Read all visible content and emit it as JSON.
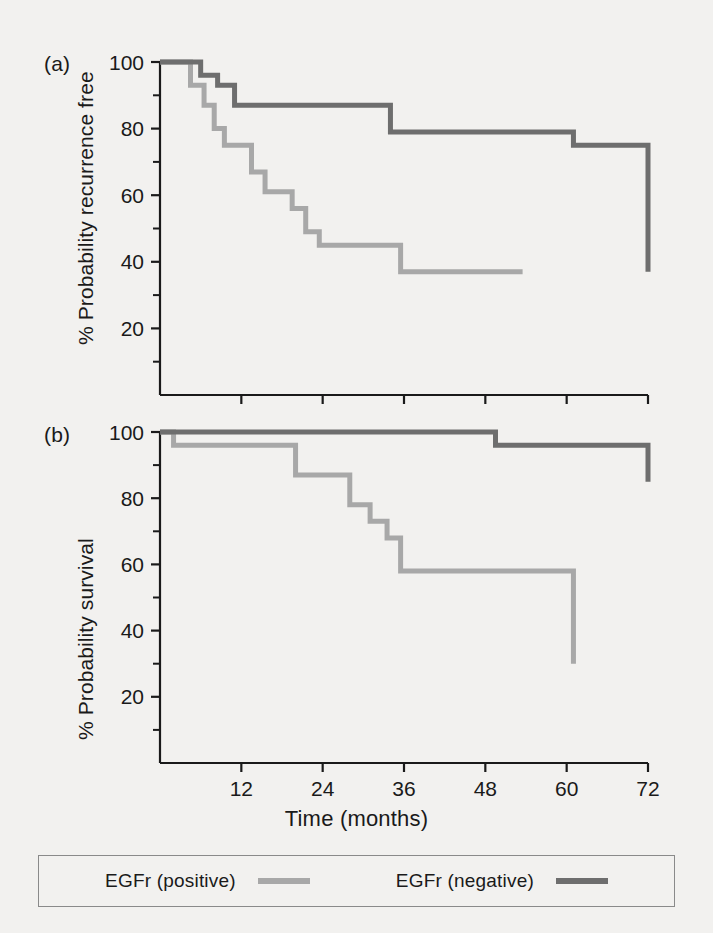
{
  "figure": {
    "background_color": "#f2f1ef",
    "axis_color": "#1a1a1a"
  },
  "panel_a": {
    "tag": "(a)",
    "ylabel": "% Probability recurrence free"
  },
  "panel_b": {
    "tag": "(b)",
    "ylabel": "% Probability survival"
  },
  "xlabel": "Time (months)",
  "legend": {
    "entries": [
      {
        "label": "EGFr (positive)",
        "color": "#a8a8a8"
      },
      {
        "label": "EGFr (negative)",
        "color": "#6e6e6e"
      }
    ]
  },
  "axis": {
    "x_ticks": [
      "12",
      "24",
      "36",
      "48",
      "60",
      "72"
    ],
    "y_ticks": [
      "20",
      "40",
      "60",
      "80",
      "100"
    ]
  },
  "chart_data": [
    {
      "type": "line",
      "panel": "(a)",
      "title": "",
      "xlabel": "Time (months)",
      "ylabel": "% Probability recurrence free",
      "xlim": [
        0,
        72
      ],
      "ylim": [
        0,
        100
      ],
      "xticks": [
        0,
        12,
        24,
        36,
        48,
        60,
        72
      ],
      "yticks": [
        20,
        40,
        60,
        80,
        100
      ],
      "yminor": [
        10,
        30,
        50,
        70,
        90
      ],
      "grid": false,
      "step": "post",
      "legend_position": "below-figure",
      "series": [
        {
          "name": "EGFr (positive)",
          "color": "#a8a8a8",
          "x": [
            0,
            2.5,
            4.5,
            6.5,
            8.0,
            9.5,
            11.5,
            13.5,
            15.5,
            17.5,
            19.5,
            21.5,
            23.5,
            26.5,
            35.5,
            53.5
          ],
          "y": [
            100,
            100,
            93,
            87,
            80,
            75,
            75,
            67,
            61,
            61,
            56,
            49,
            45,
            45,
            37,
            37
          ]
        },
        {
          "name": "EGFr (negative)",
          "color": "#6e6e6e",
          "x": [
            0,
            4.0,
            6.0,
            8.5,
            11.0,
            25.0,
            34.0,
            61.0,
            72.0
          ],
          "y": [
            100,
            100,
            96,
            93,
            87,
            87,
            79,
            75,
            37
          ]
        }
      ]
    },
    {
      "type": "line",
      "panel": "(b)",
      "title": "",
      "xlabel": "Time (months)",
      "ylabel": "% Probability survival",
      "xlim": [
        0,
        72
      ],
      "ylim": [
        0,
        100
      ],
      "xticks": [
        0,
        12,
        24,
        36,
        48,
        60,
        72
      ],
      "yticks": [
        20,
        40,
        60,
        80,
        100
      ],
      "yminor": [
        10,
        30,
        50,
        70,
        90
      ],
      "grid": false,
      "step": "post",
      "legend_position": "below-figure",
      "series": [
        {
          "name": "EGFr (positive)",
          "color": "#a8a8a8",
          "x": [
            0,
            2.0,
            18.0,
            20.0,
            28.0,
            31.0,
            33.5,
            35.5,
            58.0,
            61.0
          ],
          "y": [
            100,
            96,
            96,
            87,
            78,
            73,
            68,
            58,
            58,
            30
          ]
        },
        {
          "name": "EGFr (negative)",
          "color": "#6e6e6e",
          "x": [
            0,
            14.0,
            49.5,
            72.0
          ],
          "y": [
            100,
            100,
            96,
            85
          ]
        }
      ]
    }
  ]
}
